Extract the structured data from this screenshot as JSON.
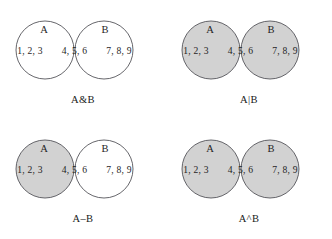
{
  "figure": {
    "background_color": "#ffffff",
    "shade_color": "#d2d2d2",
    "outline_color": "#55555a",
    "text_color": "#1f1f1f"
  },
  "geometry": {
    "circle_radius": 29,
    "left_center_x": 45,
    "right_center_x": 104,
    "center_y": 50
  },
  "labels": {
    "set_a": "A",
    "set_b": "B",
    "only_a": "1, 2, 3",
    "both": "4, 5, 6",
    "only_b": "7, 8, 9"
  },
  "panels": [
    {
      "id": "intersection",
      "caption": "A&B",
      "operation": "intersection",
      "shaded_regions": [
        "both"
      ]
    },
    {
      "id": "union",
      "caption": "A|B",
      "operation": "union",
      "shaded_regions": [
        "only_a",
        "both",
        "only_b"
      ]
    },
    {
      "id": "difference",
      "caption": "A–B",
      "operation": "difference",
      "shaded_regions": [
        "only_a"
      ]
    },
    {
      "id": "symmetric-difference",
      "caption": "A^B",
      "operation": "symmetric_difference",
      "shaded_regions": [
        "only_a",
        "only_b"
      ]
    }
  ]
}
